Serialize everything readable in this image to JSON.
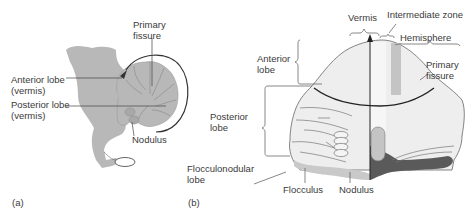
{
  "figure": {
    "panel_a": {
      "tag": "(a)",
      "labels": {
        "primary_fissure_1": "Primary",
        "primary_fissure_2": "fissure",
        "anterior_1": "Anterior lobe",
        "anterior_2": "(vermis)",
        "posterior_1": "Posterior lobe",
        "posterior_2": "(vermis)",
        "nodulus": "Nodulus"
      }
    },
    "panel_b": {
      "tag": "(b)",
      "labels": {
        "vermis": "Vermis",
        "intermediate_zone": "Intermediate zone",
        "hemisphere": "Hemisphere",
        "anterior_1": "Anterior",
        "anterior_2": "lobe",
        "primary_fissure_1": "Primary",
        "primary_fissure_2": "fissure",
        "posterior_1": "Posterior",
        "posterior_2": "lobe",
        "flocculonodular_1": "Flocculonodular",
        "flocculonodular_2": "lobe",
        "flocculus": "Flocculus",
        "nodulus": "Nodulus"
      }
    },
    "colors": {
      "tissue_gray": "#b8b8b8",
      "light_fill": "#eeeeee",
      "intermediate_zone": "#c4c4c4",
      "flocculonodular_light": "#c9c9c9",
      "flocculonodular_dark": "#5a5a5a",
      "line": "#444444"
    }
  }
}
